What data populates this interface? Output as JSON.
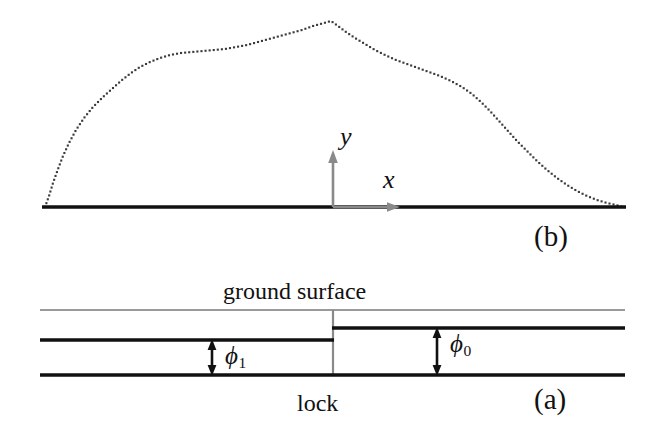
{
  "figure": {
    "width": 657,
    "height": 443,
    "background": "#ffffff",
    "ink_color": "#111111",
    "gray_color": "#8a8a8a",
    "dotted_color": "#3a3a3a"
  },
  "panel_b": {
    "tag": "(b)",
    "axis_x_label": "x",
    "axis_y_label": "y",
    "ground_line_label": "ground-line",
    "curve_label": "free-surface-profile",
    "origin": {
      "x": 333,
      "y": 207
    }
  },
  "panel_a": {
    "tag": "(a)",
    "ground_surface_label": "ground surface",
    "lock_label": "lock",
    "phi_left_symbol": "ϕ",
    "phi_left_subscript": "1",
    "phi_right_symbol": "ϕ",
    "phi_right_subscript": "0"
  },
  "chart_data": {
    "type": "line",
    "title": "",
    "subtitle": "",
    "xlabel": "x",
    "ylabel": "y",
    "grid": false,
    "legend": "none",
    "xlim": [
      42,
      626
    ],
    "ylim": [
      207,
      14
    ],
    "axis_origin": [
      333,
      207
    ],
    "series": [
      {
        "name": "free surface profile (dotted)",
        "style": "dotted",
        "color": "#3a3a3a",
        "points": [
          [
            45,
            207
          ],
          [
            49,
            196
          ],
          [
            53,
            183
          ],
          [
            58,
            169
          ],
          [
            63,
            156
          ],
          [
            69,
            143
          ],
          [
            76,
            130
          ],
          [
            84,
            118
          ],
          [
            93,
            107
          ],
          [
            103,
            97
          ],
          [
            113,
            88
          ],
          [
            122,
            80
          ],
          [
            131,
            73
          ],
          [
            140,
            67
          ],
          [
            150,
            62
          ],
          [
            160,
            58
          ],
          [
            170,
            55
          ],
          [
            181,
            53
          ],
          [
            192,
            52
          ],
          [
            203,
            51
          ],
          [
            214,
            50
          ],
          [
            225,
            49
          ],
          [
            236,
            47
          ],
          [
            247,
            45
          ],
          [
            258,
            42
          ],
          [
            269,
            39
          ],
          [
            280,
            36
          ],
          [
            291,
            33
          ],
          [
            302,
            30
          ],
          [
            313,
            26
          ],
          [
            324,
            23
          ],
          [
            331,
            21
          ],
          [
            338,
            26
          ],
          [
            346,
            32
          ],
          [
            355,
            38
          ],
          [
            365,
            44
          ],
          [
            375,
            50
          ],
          [
            385,
            55
          ],
          [
            396,
            60
          ],
          [
            407,
            64
          ],
          [
            418,
            68
          ],
          [
            429,
            72
          ],
          [
            440,
            76
          ],
          [
            451,
            81
          ],
          [
            462,
            87
          ],
          [
            472,
            94
          ],
          [
            481,
            102
          ],
          [
            490,
            111
          ],
          [
            499,
            121
          ],
          [
            508,
            131
          ],
          [
            517,
            141
          ],
          [
            527,
            151
          ],
          [
            537,
            161
          ],
          [
            547,
            170
          ],
          [
            557,
            178
          ],
          [
            567,
            185
          ],
          [
            577,
            191
          ],
          [
            587,
            196
          ],
          [
            597,
            200
          ],
          [
            607,
            203
          ],
          [
            616,
            205
          ],
          [
            623,
            207
          ]
        ]
      },
      {
        "name": "ground line (solid baseline)",
        "style": "solid",
        "color": "#111111",
        "points": [
          [
            42,
            207
          ],
          [
            626,
            207
          ]
        ]
      }
    ]
  },
  "schematic_data": {
    "type": "diagram",
    "description": "lock cross-section with two water depths",
    "lines": [
      {
        "name": "ground-surface-line-left",
        "color": "#9a9a9a",
        "x1": 40,
        "y1": 310,
        "x2": 333,
        "y2": 310
      },
      {
        "name": "ground-surface-line-right",
        "color": "#9a9a9a",
        "x1": 333,
        "y1": 310,
        "x2": 625,
        "y2": 310
      },
      {
        "name": "water-level-left",
        "color": "#111111",
        "x1": 40,
        "y1": 340,
        "x2": 333,
        "y2": 340
      },
      {
        "name": "water-level-right",
        "color": "#111111",
        "x1": 333,
        "y1": 328,
        "x2": 625,
        "y2": 328
      },
      {
        "name": "channel-bottom",
        "color": "#111111",
        "x1": 40,
        "y1": 375,
        "x2": 625,
        "y2": 375
      },
      {
        "name": "lock-gate",
        "color": "#8a8a8a",
        "x1": 333,
        "y1": 310,
        "x2": 333,
        "y2": 375
      }
    ],
    "measures": [
      {
        "name": "phi-1-measure",
        "x": 212,
        "y_top": 340,
        "y_bottom": 375
      },
      {
        "name": "phi-0-measure",
        "x": 437,
        "y_top": 328,
        "y_bottom": 375
      }
    ]
  }
}
